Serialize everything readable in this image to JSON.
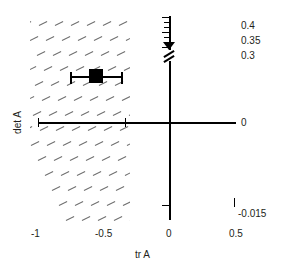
{
  "chart_data": {
    "type": "scatter",
    "title": "",
    "xlabel": "tr A",
    "ylabel": "det A",
    "xlim": [
      -1.15,
      0.5
    ],
    "ylim": [
      -0.015,
      0.4
    ],
    "grid": false,
    "legend": null,
    "x_ticks": [
      {
        "value": -1,
        "label": "-1"
      },
      {
        "value": -0.5,
        "label": "-0.5"
      },
      {
        "value": 0,
        "label": "0"
      },
      {
        "value": 0.5,
        "label": "0.5"
      }
    ],
    "y_ticks": [
      {
        "value": 0.4,
        "label": "0.4"
      },
      {
        "value": 0.35,
        "label": "0.35"
      },
      {
        "value": 0.3,
        "label": "0.3"
      },
      {
        "value": 0,
        "label": "0"
      },
      {
        "value": -0.015,
        "label": "-0.015"
      }
    ],
    "y_axis_broken": true,
    "series": [
      {
        "name": "estimate",
        "marker": "filled-square",
        "x": [
          -0.555
        ],
        "y": [
          0.155
        ],
        "xerr_low": -0.75,
        "xerr_high": -0.36
      }
    ],
    "shaded_region": {
      "name": "stability-region",
      "style": "diagonal-hatch",
      "x_range": [
        -1.07,
        -0.32
      ],
      "y_range": [
        -0.015,
        0.4
      ]
    },
    "annotations": []
  },
  "axes": {
    "x_title": "tr A",
    "y_title": "det A"
  },
  "x_tick_labels": {
    "t0": "-1",
    "t1": "-0.5",
    "t2": "0",
    "t3": "0.5"
  },
  "y_tick_labels": {
    "v04": "0.4",
    "v035": "0.35",
    "v03": "0.3",
    "v0": "0",
    "vneg": "-0.015"
  },
  "colors": {
    "axis": "#000000",
    "marker": "#000000",
    "hatch": "#6e6e6e",
    "text": "#231f20",
    "background": "#ffffff"
  }
}
